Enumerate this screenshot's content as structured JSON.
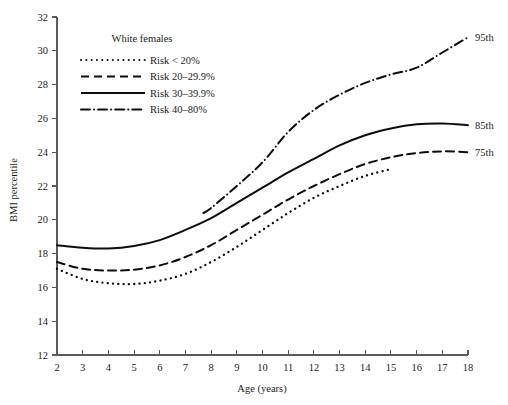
{
  "chart_data": {
    "type": "line",
    "title": "",
    "subtitle": "",
    "xlabel": "Age (years)",
    "ylabel": "BMI percentile",
    "xlim": [
      2,
      18
    ],
    "ylim": [
      12,
      32
    ],
    "grid": false,
    "legend_position": "upper-left-inside",
    "legend_title": "White females",
    "x_ticks": [
      2,
      3,
      4,
      5,
      6,
      7,
      8,
      9,
      10,
      11,
      12,
      13,
      14,
      15,
      16,
      17,
      18
    ],
    "y_ticks": [
      12,
      14,
      16,
      18,
      20,
      22,
      24,
      26,
      28,
      30,
      32
    ],
    "x_tick_labels": [
      "2",
      "3",
      "4",
      "5",
      "6",
      "7",
      "8",
      "9",
      "10",
      "11",
      "12",
      "13",
      "14",
      "15",
      "16",
      "17",
      "18"
    ],
    "y_tick_labels": [
      "12",
      "14",
      "16",
      "18",
      "20",
      "22",
      "24",
      "26",
      "28",
      "30",
      "32"
    ],
    "series": [
      {
        "name": "Risk < 20%",
        "style": "dotted",
        "color": "#0d0d0d",
        "end_label": "",
        "x": [
          2,
          3,
          4,
          5,
          6,
          7,
          8,
          9,
          10,
          11,
          12,
          13,
          14,
          15
        ],
        "values": [
          17.1,
          16.5,
          16.25,
          16.2,
          16.4,
          16.8,
          17.5,
          18.4,
          19.4,
          20.4,
          21.3,
          22.0,
          22.6,
          23.0
        ]
      },
      {
        "name": "Risk 20-29.9%",
        "style": "dashed",
        "color": "#0d0d0d",
        "end_label": "75th",
        "x": [
          2,
          3,
          4,
          5,
          6,
          7,
          8,
          9,
          10,
          11,
          12,
          13,
          14,
          15,
          16,
          17,
          18
        ],
        "values": [
          17.5,
          17.1,
          17.0,
          17.05,
          17.3,
          17.8,
          18.5,
          19.4,
          20.3,
          21.2,
          22.0,
          22.7,
          23.3,
          23.7,
          23.95,
          24.05,
          24.0
        ]
      },
      {
        "name": "Risk 30-39.9%",
        "style": "solid",
        "color": "#0d0d0d",
        "end_label": "85th",
        "x": [
          2,
          3,
          4,
          5,
          6,
          7,
          8,
          9,
          10,
          11,
          12,
          13,
          14,
          15,
          16,
          17,
          18
        ],
        "values": [
          18.5,
          18.35,
          18.3,
          18.45,
          18.8,
          19.4,
          20.1,
          21.0,
          21.9,
          22.8,
          23.6,
          24.4,
          25.0,
          25.4,
          25.65,
          25.7,
          25.6
        ]
      },
      {
        "name": "Risk 40-80%",
        "style": "dashdot",
        "color": "#0d0d0d",
        "end_label": "95th",
        "x": [
          7.7,
          8,
          9,
          10,
          11,
          12,
          13,
          14,
          15,
          16,
          17,
          18
        ],
        "values": [
          20.4,
          20.7,
          22.0,
          23.4,
          25.2,
          26.5,
          27.4,
          28.1,
          28.6,
          29.0,
          29.9,
          30.8
        ]
      }
    ],
    "annotations": [
      {
        "text": "95th",
        "x": 18,
        "y": 30.8
      },
      {
        "text": "85th",
        "x": 18,
        "y": 25.6
      },
      {
        "text": "75th",
        "x": 18,
        "y": 24.0
      }
    ]
  },
  "legend": {
    "title": "White females",
    "items": [
      {
        "label": "Risk < 20%",
        "style": "dotted"
      },
      {
        "label": "Risk 20–29.9%",
        "style": "dashed"
      },
      {
        "label": "Risk 30–39.9%",
        "style": "solid"
      },
      {
        "label": "Risk 40–80%",
        "style": "dashdot"
      }
    ]
  },
  "axes": {
    "x_title": "Age (years)",
    "y_title": "BMI percentile"
  }
}
